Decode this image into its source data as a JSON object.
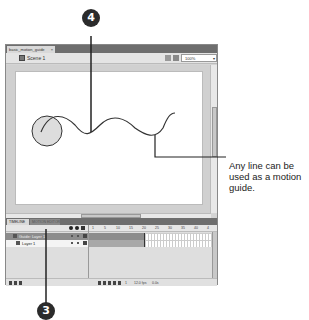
{
  "document": {
    "tab_label": "basic_motion_guide",
    "tab_close": "×"
  },
  "edit_bar": {
    "scene_label": "Scene 1",
    "zoom_value": "100%",
    "zoom_arrow": "▾"
  },
  "stage": {
    "circle_fill": "#dddddd",
    "stroke_color": "#333333"
  },
  "panel_tabs": {
    "active": "TIMELINE",
    "inactive": "MOTION EDITOR"
  },
  "timeline": {
    "ruler": [
      "1",
      "5",
      "10",
      "15",
      "20",
      "25",
      "30",
      "35",
      "40",
      "4"
    ],
    "layers": [
      {
        "name": "Guide: Layer 1",
        "type": "guide"
      },
      {
        "name": "Layer 1",
        "type": "normal"
      }
    ],
    "footer": {
      "frame_number": "1",
      "fps": "12.0 fps",
      "elapsed": "0.0s"
    }
  },
  "callouts": {
    "top_number": "4",
    "bottom_number": "3",
    "caption": "Any line can be used as a motion guide."
  }
}
